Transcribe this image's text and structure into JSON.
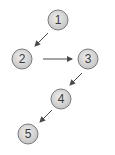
{
  "diagram": {
    "nodes": [
      {
        "id": "1",
        "label": "1",
        "x": 58,
        "y": 20
      },
      {
        "id": "2",
        "label": "2",
        "x": 22,
        "y": 59
      },
      {
        "id": "3",
        "label": "3",
        "x": 88,
        "y": 59
      },
      {
        "id": "4",
        "label": "4",
        "x": 61,
        "y": 99
      },
      {
        "id": "5",
        "label": "5",
        "x": 28,
        "y": 134
      }
    ],
    "edges": [
      {
        "from": "1",
        "to": "2"
      },
      {
        "from": "2",
        "to": "3"
      },
      {
        "from": "3",
        "to": "4"
      },
      {
        "from": "4",
        "to": "5"
      }
    ],
    "colors": {
      "node_fill": "#d6d6d6",
      "node_stroke": "#7a7a7a",
      "arrow": "#4a4a4a"
    }
  }
}
